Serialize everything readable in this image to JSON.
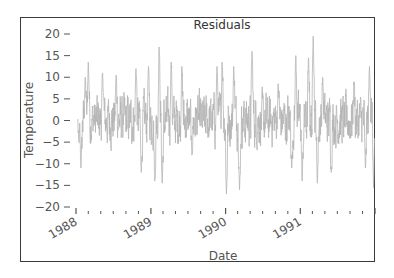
{
  "chart_data": {
    "type": "line",
    "title": "Residuals",
    "xlabel": "Date",
    "ylabel": "Temperature",
    "ylim": [
      -20,
      20
    ],
    "yticks": [
      20,
      15,
      10,
      5,
      0,
      -5,
      -10,
      -15,
      -20
    ],
    "ytick_labels": [
      "20",
      "15",
      "10",
      "5",
      "0",
      "−5",
      "−10",
      "−15",
      "−20"
    ],
    "xticks_major": [
      "1988",
      "1989",
      "1990",
      "1991"
    ],
    "x_range": [
      "1988-01",
      "1992-01"
    ],
    "grid": false,
    "legend": null,
    "series": [
      {
        "name": "Residuals",
        "color": "#b5b5b5",
        "description": "Daily temperature residuals, 1988-1991, oscillating roughly between -17 and +19",
        "key_points": [
          {
            "date": "1988-01-15",
            "value": -5
          },
          {
            "date": "1988-01-25",
            "value": -11
          },
          {
            "date": "1988-02-15",
            "value": 10
          },
          {
            "date": "1988-03-01",
            "value": 13.5
          },
          {
            "date": "1988-05-10",
            "value": 11
          },
          {
            "date": "1988-07-15",
            "value": 10.5
          },
          {
            "date": "1988-10-20",
            "value": 12
          },
          {
            "date": "1988-11-15",
            "value": -12
          },
          {
            "date": "1988-12-20",
            "value": 12.5
          },
          {
            "date": "1989-01-20",
            "value": -14
          },
          {
            "date": "1989-02-10",
            "value": 17
          },
          {
            "date": "1989-02-25",
            "value": -14.5
          },
          {
            "date": "1989-04-10",
            "value": 13.5
          },
          {
            "date": "1989-06-01",
            "value": 12.5
          },
          {
            "date": "1989-07-20",
            "value": -8
          },
          {
            "date": "1989-11-20",
            "value": 12.5
          },
          {
            "date": "1989-12-15",
            "value": 13.5
          },
          {
            "date": "1990-01-05",
            "value": -17
          },
          {
            "date": "1990-02-10",
            "value": 12.5
          },
          {
            "date": "1990-03-10",
            "value": -16
          },
          {
            "date": "1990-05-10",
            "value": 16
          },
          {
            "date": "1990-09-15",
            "value": 8.5
          },
          {
            "date": "1990-11-20",
            "value": -11
          },
          {
            "date": "1990-12-10",
            "value": 15
          },
          {
            "date": "1991-01-10",
            "value": -14
          },
          {
            "date": "1991-02-10",
            "value": 14.5
          },
          {
            "date": "1991-03-05",
            "value": 19.5
          },
          {
            "date": "1991-03-25",
            "value": -14.5
          },
          {
            "date": "1991-04-20",
            "value": 10
          },
          {
            "date": "1991-06-01",
            "value": -12
          },
          {
            "date": "1991-09-20",
            "value": 9
          },
          {
            "date": "1991-11-15",
            "value": -11
          },
          {
            "date": "1991-12-05",
            "value": 12.5
          },
          {
            "date": "1991-12-25",
            "value": -15.5
          }
        ]
      }
    ]
  }
}
